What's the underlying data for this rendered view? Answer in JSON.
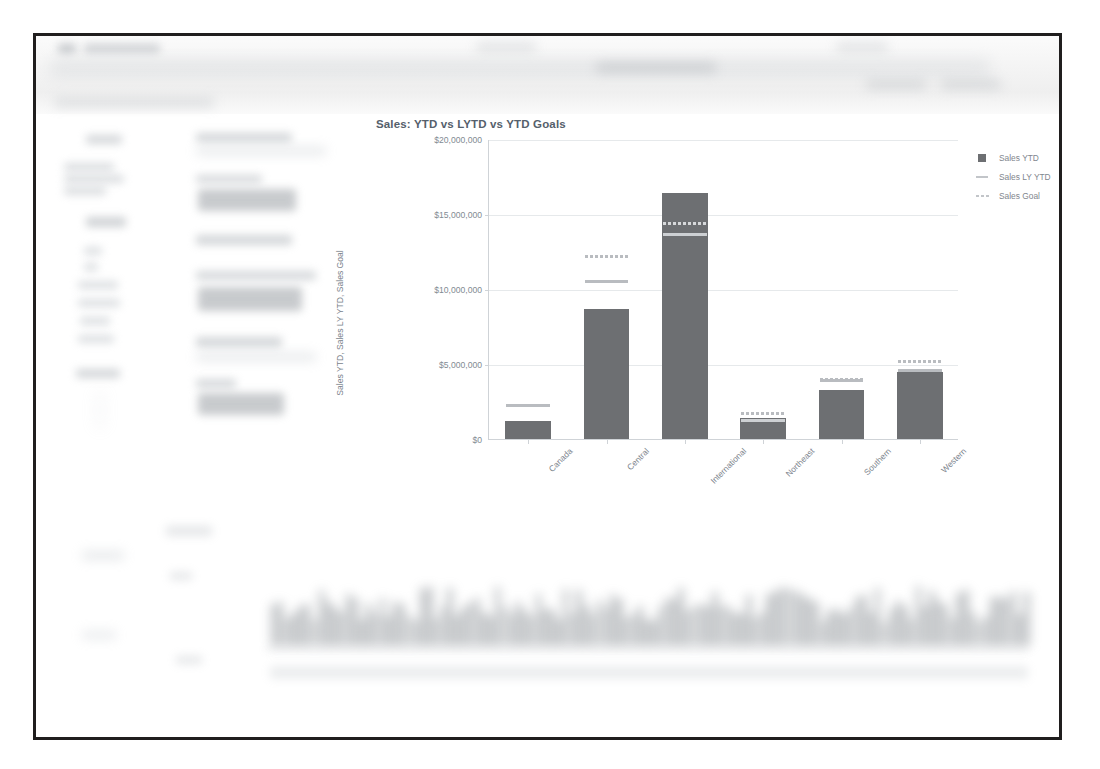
{
  "window": {
    "frame_color": "#201e1e",
    "background": "#ffffff",
    "chrome_note": "blurred application toolbar"
  },
  "chart_data": {
    "type": "bar",
    "title": "Sales: YTD vs LYTD vs YTD Goals",
    "xlabel": "",
    "ylabel": "Sales YTD, Sales LY YTD, Sales Goal",
    "categories": [
      "Canada",
      "Central",
      "International",
      "Northeast",
      "Southern",
      "Western"
    ],
    "ylim": [
      0,
      20000000
    ],
    "yticks": [
      0,
      5000000,
      10000000,
      15000000,
      20000000
    ],
    "ytick_labels": [
      "$0",
      "$5,000,000",
      "$10,000,000",
      "$15,000,000",
      "$20,000,000"
    ],
    "grid": true,
    "legend_position": "right",
    "series": [
      {
        "name": "Sales YTD",
        "type": "bar",
        "color": "#6d6f72",
        "values": [
          1200000,
          8700000,
          16400000,
          1400000,
          3300000,
          4500000
        ]
      },
      {
        "name": "Sales LY YTD",
        "type": "marker-line",
        "color": "#c2c5c9",
        "values": [
          2250000,
          10500000,
          13650000,
          1250000,
          3900000,
          4600000
        ]
      },
      {
        "name": "Sales Goal",
        "type": "marker-dash",
        "color": "#c2c5c9",
        "values": [
          2250000,
          12200000,
          14350000,
          1700000,
          3950000,
          5200000
        ]
      }
    ]
  },
  "legend": {
    "items": [
      {
        "label": "Sales YTD",
        "swatch": "square"
      },
      {
        "label": "Sales LY YTD",
        "swatch": "line"
      },
      {
        "label": "Sales Goal",
        "swatch": "dash"
      }
    ]
  },
  "yticks": {
    "t0": "$0",
    "t1": "$5,000,000",
    "t2": "$10,000,000",
    "t3": "$15,000,000",
    "t4": "$20,000,000"
  },
  "xlabels": {
    "c0": "Canada",
    "c1": "Central",
    "c2": "International",
    "c3": "Northeast",
    "c4": "Southern",
    "c5": "Western"
  },
  "obscured": {
    "note": "Sidebar, KPI panel, top toolbar and bottom chart are blurred beyond legibility in the source screenshot."
  }
}
